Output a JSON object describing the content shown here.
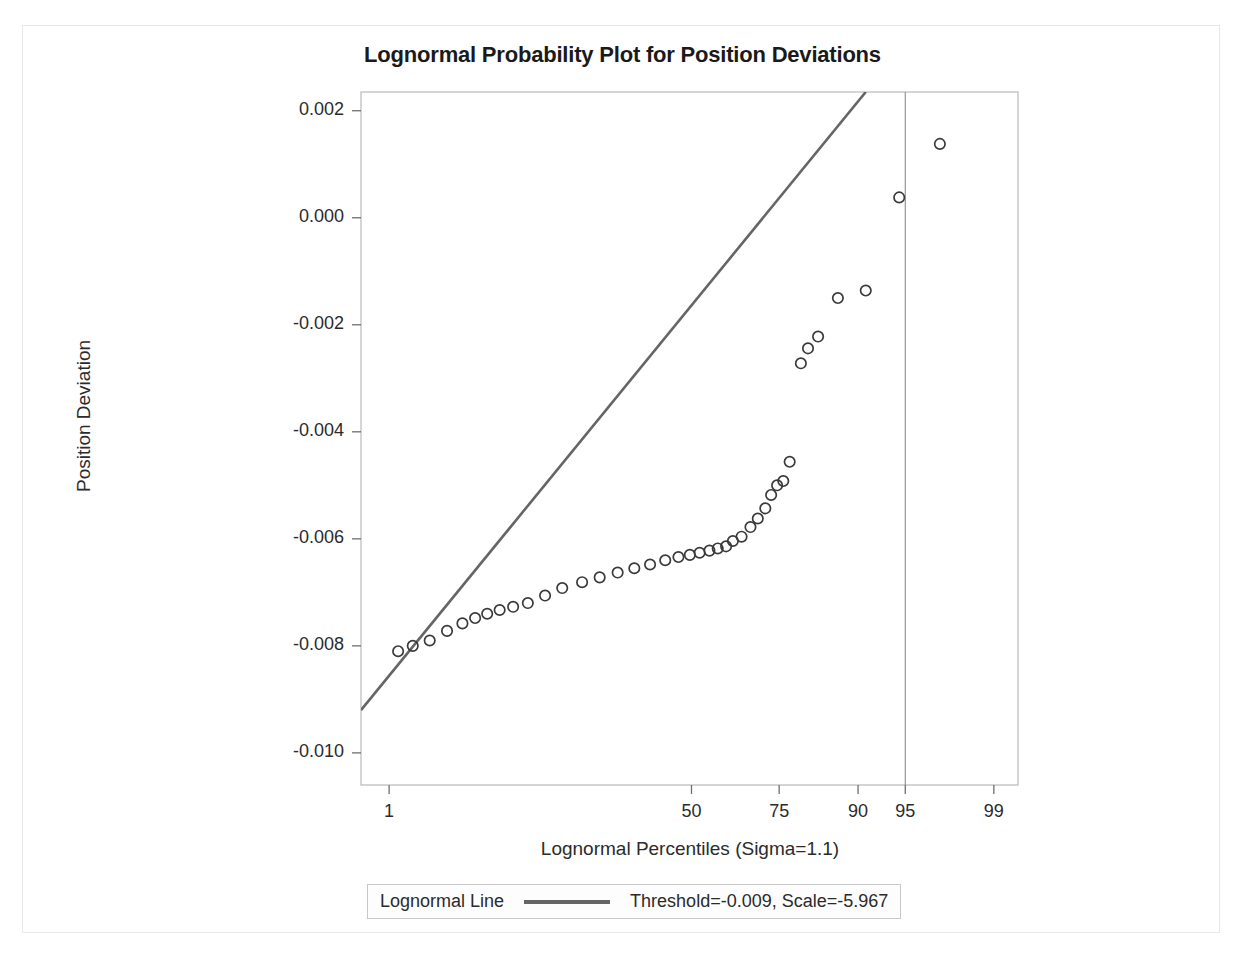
{
  "chart_data": {
    "type": "scatter",
    "title": "Lognormal Probability Plot for Position Deviations",
    "xlabel": "Lognormal Percentiles (Sigma=1.1)",
    "ylabel": "Position Deviation",
    "grid": false,
    "xtick_labels": [
      "1",
      "50",
      "75",
      "90",
      "95",
      "99"
    ],
    "xtick_values": [
      1,
      50,
      75,
      90,
      95,
      99
    ],
    "ytick_labels": [
      "0.002",
      "0.000",
      "-0.002",
      "-0.004",
      "-0.006",
      "-0.008",
      "-0.010"
    ],
    "ytick_values": [
      0.002,
      0.0,
      -0.002,
      -0.004,
      -0.006,
      -0.008,
      -0.01
    ],
    "ylim": [
      -0.0106,
      0.00235
    ],
    "xlim": [
      0.55,
      99.4
    ],
    "marker": "open-circle",
    "marker_color": "#3a3a3a",
    "line_color": "#656565",
    "reference_line_percentile": 95,
    "series": [
      {
        "name": "Position Deviation",
        "points": [
          {
            "percentile": 1.2,
            "value": -0.0081
          },
          {
            "percentile": 1.6,
            "value": -0.008
          },
          {
            "percentile": 2.2,
            "value": -0.0079
          },
          {
            "percentile": 3.0,
            "value": -0.00772
          },
          {
            "percentile": 3.9,
            "value": -0.00758
          },
          {
            "percentile": 4.8,
            "value": -0.00748
          },
          {
            "percentile": 5.8,
            "value": -0.0074
          },
          {
            "percentile": 7.0,
            "value": -0.00733
          },
          {
            "percentile": 8.5,
            "value": -0.00727
          },
          {
            "percentile": 10.4,
            "value": -0.0072
          },
          {
            "percentile": 13.0,
            "value": -0.00706
          },
          {
            "percentile": 16.0,
            "value": -0.00692
          },
          {
            "percentile": 20.0,
            "value": -0.00681
          },
          {
            "percentile": 24.0,
            "value": -0.00672
          },
          {
            "percentile": 28.5,
            "value": -0.00663
          },
          {
            "percentile": 33.0,
            "value": -0.00655
          },
          {
            "percentile": 37.5,
            "value": -0.00648
          },
          {
            "percentile": 42.0,
            "value": -0.0064
          },
          {
            "percentile": 46.0,
            "value": -0.00634
          },
          {
            "percentile": 49.5,
            "value": -0.0063
          },
          {
            "percentile": 52.5,
            "value": -0.00626
          },
          {
            "percentile": 55.5,
            "value": -0.00622
          },
          {
            "percentile": 58.0,
            "value": -0.00618
          },
          {
            "percentile": 60.5,
            "value": -0.00614
          },
          {
            "percentile": 62.5,
            "value": -0.00604
          },
          {
            "percentile": 65.0,
            "value": -0.00596
          },
          {
            "percentile": 67.5,
            "value": -0.00578
          },
          {
            "percentile": 69.5,
            "value": -0.00562
          },
          {
            "percentile": 71.5,
            "value": -0.00543
          },
          {
            "percentile": 73.0,
            "value": -0.00518
          },
          {
            "percentile": 74.5,
            "value": -0.005
          },
          {
            "percentile": 76.0,
            "value": -0.00492
          },
          {
            "percentile": 77.5,
            "value": -0.00456
          },
          {
            "percentile": 80.0,
            "value": -0.00272
          },
          {
            "percentile": 81.5,
            "value": -0.00244
          },
          {
            "percentile": 83.5,
            "value": -0.00222
          },
          {
            "percentile": 87.0,
            "value": -0.0015
          },
          {
            "percentile": 91.0,
            "value": -0.00136
          },
          {
            "percentile": 94.5,
            "value": 0.00038
          },
          {
            "percentile": 97.2,
            "value": 0.00138
          }
        ]
      }
    ],
    "fit_line": {
      "name": "Lognormal Line",
      "threshold": -0.009,
      "scale": -5.967,
      "label": "Threshold=-0.009, Scale=-5.967",
      "start": {
        "percentile": 0.55,
        "value": -0.0092
      },
      "end": {
        "percentile": 91.0,
        "value": 0.00235
      }
    }
  },
  "legend": {
    "name_label": "Lognormal Line",
    "value_label": "Threshold=-0.009, Scale=-5.967"
  }
}
